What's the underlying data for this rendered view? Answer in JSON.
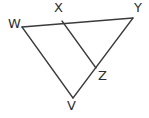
{
  "figure": {
    "type": "geometry-diagram",
    "background_color": "#ffffff",
    "line_color": "#3b3b3b",
    "label_color": "#2e2e2e",
    "width": 149,
    "height": 118,
    "vertices": [
      {
        "id": "W",
        "label": "W",
        "x": 22,
        "y": 27,
        "label_x": 8,
        "label_y": 17
      },
      {
        "id": "X",
        "label": "X",
        "x": 62,
        "y": 21,
        "label_x": 54,
        "label_y": 1
      },
      {
        "id": "Y",
        "label": "Y",
        "x": 133,
        "y": 18,
        "label_x": 134,
        "label_y": 1
      },
      {
        "id": "Z",
        "label": "Z",
        "x": 96,
        "y": 68,
        "label_x": 98,
        "label_y": 69
      },
      {
        "id": "V",
        "label": "V",
        "x": 73,
        "y": 98,
        "label_x": 67,
        "label_y": 99
      }
    ],
    "segments": [
      {
        "id": "WY",
        "from": "W",
        "to": "Y",
        "x1": 22,
        "y1": 27,
        "x2": 133,
        "y2": 18
      },
      {
        "id": "WV",
        "from": "W",
        "to": "V",
        "x1": 22,
        "y1": 27,
        "x2": 73,
        "y2": 98
      },
      {
        "id": "XZ",
        "from": "X",
        "to": "Z",
        "x1": 62,
        "y1": 21,
        "x2": 96,
        "y2": 68
      },
      {
        "id": "YV",
        "from": "Y",
        "to": "V",
        "x1": 133,
        "y1": 18,
        "x2": 73,
        "y2": 98
      }
    ]
  }
}
